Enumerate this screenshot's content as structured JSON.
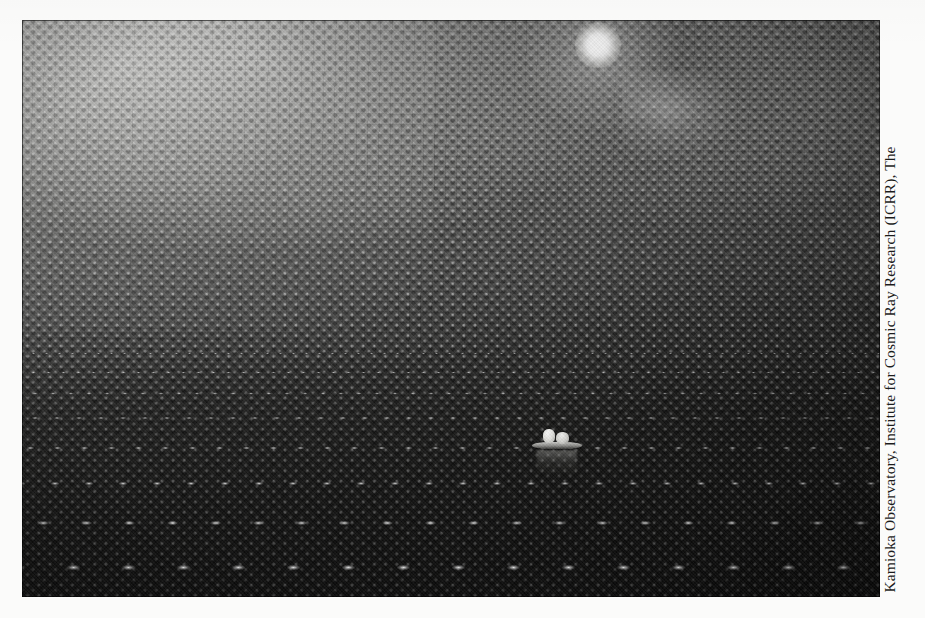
{
  "page": {
    "background_color": "#fbfbfa",
    "width": 925,
    "height": 618
  },
  "photograph": {
    "alt_description": "Interior of the Super-Kamiokande water Cherenkov neutrino detector, showing thousands of photomultiplier tubes lining the curved dome and floor, with a small inflatable boat carrying two workers at the centre",
    "subject": "Super-Kamiokande detector interior",
    "rendering": "black-and-white halftone print",
    "frame_color": "#0a0a0a",
    "elements": {
      "dome_wall_label": "photomultiplier tube array (dome wall)",
      "floor_label": "photomultiplier tube array (floor plane)",
      "lamp_label": "work lamp",
      "boat_label": "inflatable boat with two workers",
      "reflection_label": "water surface reflection"
    },
    "tones": {
      "highlight": "#e8e8e4",
      "midtone": "#7d7d7b",
      "shadow": "#111110"
    }
  },
  "credit": {
    "text": "Kamioka Observatory, Institute for Cosmic Ray Research (ICRR), The",
    "orientation": "rotated-90-counterclockwise",
    "color": "#1b1b1b"
  }
}
